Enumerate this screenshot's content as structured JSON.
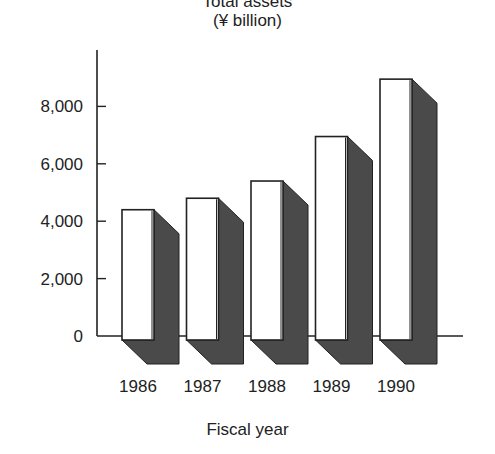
{
  "chart_data": {
    "type": "bar",
    "title": "Total assets",
    "subtitle": "(¥ billion)",
    "xlabel": "Fiscal year",
    "ylabel": "",
    "categories": [
      "1986",
      "1987",
      "1988",
      "1989",
      "1990"
    ],
    "values": [
      4400,
      4800,
      5400,
      6950,
      8950
    ],
    "ylim": [
      0,
      9500
    ],
    "yticks": [
      0,
      2000,
      4000,
      6000,
      8000
    ],
    "ytick_labels": [
      "0",
      "2,000",
      "4,000",
      "6,000",
      "8,000"
    ],
    "grid": false,
    "legend": null,
    "style": "3d-bars-with-dark-shadow"
  },
  "colors": {
    "bar_face": "#ffffff",
    "bar_shadow": "#4a4a4a",
    "axis": "#222222"
  }
}
